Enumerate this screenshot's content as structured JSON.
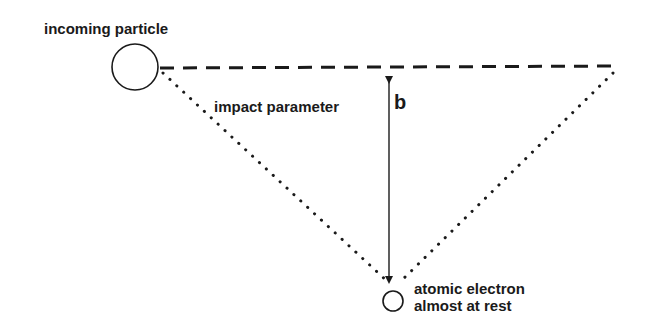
{
  "labels": {
    "incoming_particle": "incoming particle",
    "impact_parameter": "impact parameter",
    "b_symbol": "b",
    "electron_line1": "atomic electron",
    "electron_line2": "almost at rest"
  },
  "colors": {
    "ink": "#1a1a1a",
    "background": "#ffffff"
  },
  "geometry": {
    "incoming_particle": {
      "cx": 135,
      "cy": 67,
      "r": 23
    },
    "electron": {
      "cx": 393,
      "cy": 301,
      "r": 10
    },
    "trajectory_dashed": {
      "x1": 160,
      "y1": 68,
      "x2": 620,
      "y2": 66
    },
    "impact_arrow": {
      "x": 389,
      "y1": 70,
      "y2": 286
    },
    "dotted_left": {
      "x1": 163,
      "y1": 73,
      "x2": 388,
      "y2": 282
    },
    "dotted_right": {
      "x1": 613,
      "y1": 73,
      "x2": 400,
      "y2": 282
    }
  }
}
